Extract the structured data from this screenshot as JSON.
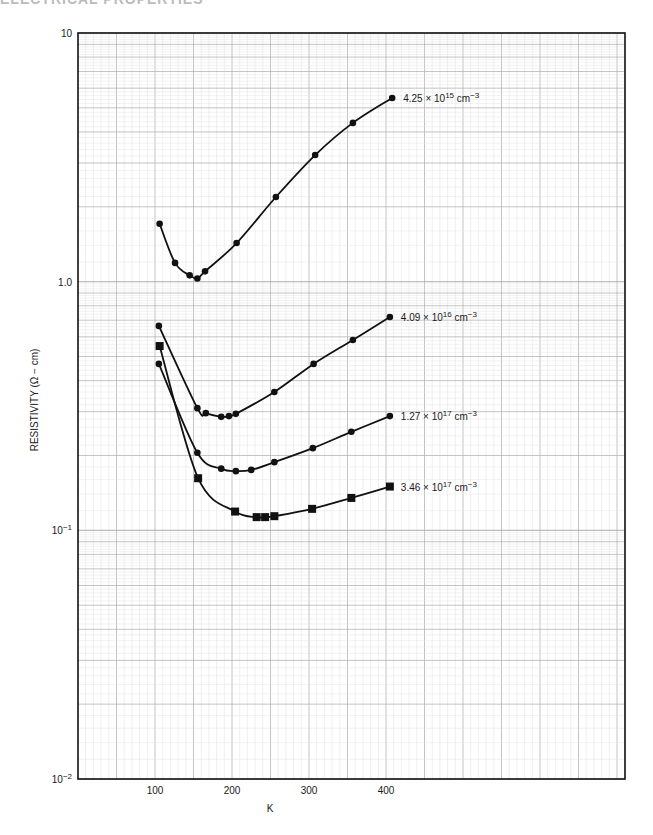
{
  "page": {
    "header_fragment": "ELECTRICAL PROPERTIES"
  },
  "chart_data": {
    "type": "line",
    "title": "",
    "xlabel": "K",
    "ylabel": "RESISTIVITY (Ω − cm)",
    "x_scale": "linear",
    "y_scale": "log",
    "xlim": [
      0,
      730
    ],
    "ylim": [
      0.01,
      10
    ],
    "x_ticks": [
      100,
      200,
      300,
      400
    ],
    "x_tick_labels": [
      "100",
      "200",
      "300",
      "400"
    ],
    "y_ticks": [
      10,
      1.0,
      0.1,
      0.01
    ],
    "y_tick_labels": [
      "10",
      "1.0",
      "10⁻¹",
      "10⁻²"
    ],
    "grid": true,
    "legend": "inline labels at right end of each curve",
    "series": [
      {
        "name": "4.25 × 10¹⁵ cm⁻³",
        "label_parts": {
          "mantissa": "4.25",
          "exp": "15"
        },
        "marker": "circle",
        "x": [
          106,
          126,
          145,
          155,
          165,
          206,
          257,
          308,
          357,
          408
        ],
        "values": [
          1.71,
          1.19,
          1.06,
          1.03,
          1.1,
          1.43,
          2.19,
          3.23,
          4.35,
          5.48
        ]
      },
      {
        "name": "4.09 × 10¹⁶ cm⁻³",
        "label_parts": {
          "mantissa": "4.09",
          "exp": "16"
        },
        "marker": "circle",
        "x": [
          105,
          155,
          166,
          186,
          196,
          205,
          255,
          306,
          357,
          405
        ],
        "values": [
          0.664,
          0.31,
          0.296,
          0.286,
          0.288,
          0.294,
          0.36,
          0.467,
          0.583,
          0.721
        ]
      },
      {
        "name": "1.27 × 10¹⁷ cm⁻³",
        "label_parts": {
          "mantissa": "1.27",
          "exp": "17"
        },
        "marker": "circle",
        "x": [
          105,
          155,
          186,
          205,
          225,
          255,
          305,
          355,
          405
        ],
        "values": [
          0.467,
          0.205,
          0.177,
          0.173,
          0.175,
          0.188,
          0.214,
          0.249,
          0.288
        ]
      },
      {
        "name": "3.46 × 10¹⁷ cm⁻³",
        "label_parts": {
          "mantissa": "3.46",
          "exp": "17"
        },
        "marker": "square",
        "x": [
          106,
          156,
          204,
          232,
          243,
          255,
          304,
          355,
          405
        ],
        "values": [
          0.551,
          0.162,
          0.119,
          0.113,
          0.113,
          0.114,
          0.122,
          0.135,
          0.15
        ]
      }
    ]
  }
}
